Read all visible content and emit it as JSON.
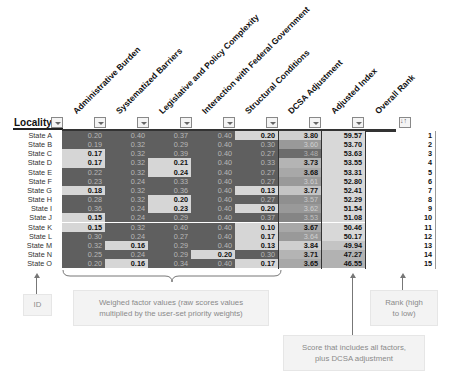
{
  "table": {
    "locality_header": "Locality",
    "columns": [
      {
        "label": "Administrative Burden"
      },
      {
        "label": "Systematized Barriers"
      },
      {
        "label": "Legislative and Policy Complexity"
      },
      {
        "label": "Interaction with Federal Government"
      },
      {
        "label": "Structural Conditions"
      },
      {
        "label": "DCSA Adjustment"
      },
      {
        "label": "Adjusted Index"
      },
      {
        "label": "Overall Rank"
      }
    ],
    "rows": [
      {
        "locality": "State A",
        "admin": "0.20",
        "sys": "0.40",
        "leg": "0.37",
        "fed": "0.40",
        "struct": "0.20",
        "dcsa": "3.80",
        "index": "59.57",
        "rank": "1"
      },
      {
        "locality": "State B",
        "admin": "0.19",
        "sys": "0.32",
        "leg": "0.29",
        "fed": "0.40",
        "struct": "0.30",
        "dcsa": "3.60",
        "index": "53.70",
        "rank": "2"
      },
      {
        "locality": "State C",
        "admin": "0.17",
        "sys": "0.32",
        "leg": "0.39",
        "fed": "0.40",
        "struct": "0.27",
        "dcsa": "3.48",
        "index": "53.63",
        "rank": "3"
      },
      {
        "locality": "State D",
        "admin": "0.17",
        "sys": "0.32",
        "leg": "0.21",
        "fed": "0.40",
        "struct": "0.33",
        "dcsa": "3.73",
        "index": "53.55",
        "rank": "4"
      },
      {
        "locality": "State E",
        "admin": "0.22",
        "sys": "0.32",
        "leg": "0.24",
        "fed": "0.40",
        "struct": "0.27",
        "dcsa": "3.68",
        "index": "53.31",
        "rank": "5"
      },
      {
        "locality": "State F",
        "admin": "0.23",
        "sys": "0.24",
        "leg": "0.33",
        "fed": "0.40",
        "struct": "0.27",
        "dcsa": "3.61",
        "index": "52.80",
        "rank": "6"
      },
      {
        "locality": "State G",
        "admin": "0.18",
        "sys": "0.32",
        "leg": "0.36",
        "fed": "0.40",
        "struct": "0.13",
        "dcsa": "3.77",
        "index": "52.41",
        "rank": "7"
      },
      {
        "locality": "State H",
        "admin": "0.28",
        "sys": "0.32",
        "leg": "0.20",
        "fed": "0.40",
        "struct": "0.27",
        "dcsa": "3.57",
        "index": "52.29",
        "rank": "8"
      },
      {
        "locality": "State I",
        "admin": "0.36",
        "sys": "0.24",
        "leg": "0.23",
        "fed": "0.40",
        "struct": "0.20",
        "dcsa": "3.62",
        "index": "51.54",
        "rank": "9"
      },
      {
        "locality": "State J",
        "admin": "0.15",
        "sys": "0.24",
        "leg": "0.29",
        "fed": "0.40",
        "struct": "0.37",
        "dcsa": "3.53",
        "index": "51.08",
        "rank": "10"
      },
      {
        "locality": "State K",
        "admin": "0.15",
        "sys": "0.32",
        "leg": "0.40",
        "fed": "0.40",
        "struct": "0.10",
        "dcsa": "3.67",
        "index": "50.46",
        "rank": "11"
      },
      {
        "locality": "State L",
        "admin": "0.30",
        "sys": "0.24",
        "leg": "0.27",
        "fed": "0.40",
        "struct": "0.17",
        "dcsa": "3.64",
        "index": "50.17",
        "rank": "12"
      },
      {
        "locality": "State M",
        "admin": "0.32",
        "sys": "0.16",
        "leg": "0.29",
        "fed": "0.40",
        "struct": "0.13",
        "dcsa": "3.84",
        "index": "49.94",
        "rank": "13"
      },
      {
        "locality": "State N",
        "admin": "0.25",
        "sys": "0.24",
        "leg": "0.29",
        "fed": "0.20",
        "struct": "0.30",
        "dcsa": "3.71",
        "index": "47.27",
        "rank": "14"
      },
      {
        "locality": "State O",
        "admin": "0.20",
        "sys": "0.16",
        "leg": "0.34",
        "fed": "0.40",
        "struct": "0.17",
        "dcsa": "3.65",
        "index": "46.55",
        "rank": "15"
      }
    ]
  },
  "annotations": {
    "id": "ID",
    "weighed": "Weighed factor values (raw scores values multiplied by the user-set priority weights)",
    "rank": "Rank (high to low)",
    "score": "Score that includes all factors, plus DCSA adjustment"
  },
  "colors": {
    "dark_cell": "#5f5f5f",
    "light_cell": "#d6d6d6",
    "note_bg": "#f3f3f3",
    "note_text": "#8a8a8a"
  }
}
